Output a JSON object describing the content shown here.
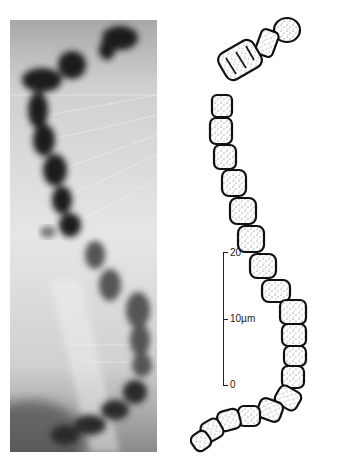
{
  "figure": {
    "left_panel": {
      "type": "micrograph",
      "description": "grayscale light micrograph of a chromosome-like banded structure"
    },
    "right_panel": {
      "type": "line-drawing",
      "description": "stippled ink tracing of the same segmented chain"
    },
    "scale_bar": {
      "unit_label": "10µm",
      "ticks": [
        {
          "label": "20",
          "position": "top"
        },
        {
          "label": "10µm",
          "position": "middle"
        },
        {
          "label": "0",
          "position": "bottom"
        }
      ]
    },
    "colors": {
      "ink": "#111111",
      "paper": "#ffffff",
      "photo_dark": "#1a1a1a",
      "photo_light": "#e8e8e8"
    }
  }
}
